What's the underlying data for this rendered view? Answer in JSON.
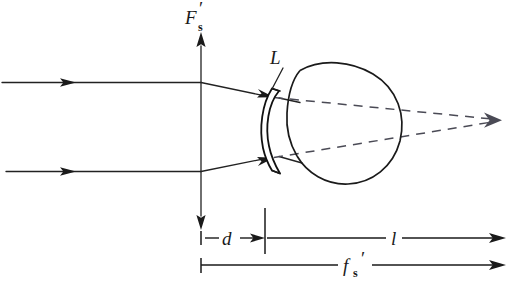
{
  "figure": {
    "type": "optical-ray-diagram",
    "background_color": "#ffffff",
    "ink_color": "#1a1a1a",
    "dashed_color": "#4a4a55",
    "width": 513,
    "height": 294
  },
  "labels": {
    "focal_point": {
      "base": "F",
      "subscript": "s",
      "prime": "′",
      "full": "F′s",
      "x": 193,
      "y": 22
    },
    "lens": {
      "text": "L",
      "x": 272,
      "y": 62
    },
    "distance_d": {
      "text": "d",
      "x": 228,
      "y": 244
    },
    "distance_l": {
      "text": "l",
      "x": 393,
      "y": 238
    },
    "focal_length": {
      "base": "f",
      "subscript": "s",
      "prime": "′",
      "full": "f′s",
      "x": 348,
      "y": 272
    }
  },
  "elements": {
    "axis_label": "vertical focal plane axis with double arrowheads",
    "incoming_rays": "two parallel horizontal rays from the left with arrowheads",
    "refracted_rays": "rays bending at the focal plane toward the lens",
    "dashed_rays": "two dashed construction lines converging at the far right point",
    "lens_shape": "meniscus contact lens",
    "eye_shape": "eyeball globe with cornea bulge"
  },
  "geometry": {
    "axis_x": 201,
    "axis_top_y": 34,
    "axis_bottom_y": 228,
    "ray_top_y": 82,
    "ray_bottom_y": 171,
    "lens_x": 265,
    "convergence_point": {
      "x": 500,
      "y": 120
    },
    "eye_center": {
      "x": 350,
      "y": 121
    },
    "eye_radius": 56,
    "dim_l_y": 238,
    "dim_f_y": 265,
    "dim_right_x": 505
  },
  "dimensions": [
    {
      "name": "d",
      "from_x": 201,
      "to_x": 265,
      "y": 238,
      "style": "inward-arrows"
    },
    {
      "name": "l",
      "from_x": 265,
      "to_x": 505,
      "y": 238,
      "style": "right-arrow"
    },
    {
      "name": "f's",
      "from_x": 201,
      "to_x": 505,
      "y": 265,
      "style": "right-arrow"
    }
  ]
}
